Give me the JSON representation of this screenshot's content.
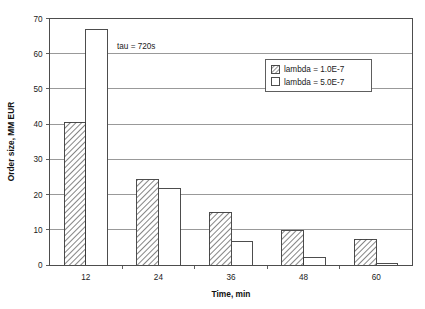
{
  "chart_data": {
    "type": "bar",
    "title": "",
    "xlabel": "Time, min",
    "ylabel": "Order size, MM EUR",
    "categories": [
      "12",
      "24",
      "36",
      "48",
      "60"
    ],
    "series": [
      {
        "name": "lambda = 1.0E-7",
        "values": [
          40.5,
          24.2,
          15.0,
          9.7,
          7.3
        ],
        "fill": "hatched"
      },
      {
        "name": "lambda = 5.0E-7",
        "values": [
          67.0,
          21.8,
          6.8,
          2.0,
          0.5
        ],
        "fill": "white"
      }
    ],
    "ylim": [
      0,
      70
    ],
    "ytick_labels": [
      "0",
      "10",
      "20",
      "30",
      "40",
      "50",
      "60",
      "70"
    ],
    "ytick_values": [
      0,
      10,
      20,
      30,
      40,
      50,
      60,
      70
    ],
    "xtick_labels": [
      "12",
      "24",
      "36",
      "48",
      "60"
    ],
    "grid": "horizontal",
    "legend_position": "upper-right-inside",
    "annotations": [
      {
        "text": "tau = 720s",
        "x_category": "12",
        "y_value": 62
      }
    ]
  },
  "legend": {
    "entries": [
      {
        "label": "lambda = 1.0E-7",
        "swatch": "hatched-swatch"
      },
      {
        "label": "lambda = 5.0E-7",
        "swatch": "white-swatch"
      }
    ]
  },
  "annotation": {
    "tau_label": "tau = 720s"
  },
  "axes": {
    "y_title": "Order size, MM EUR",
    "x_title": "Time, min",
    "y_ticks": [
      "70",
      "60",
      "50",
      "40",
      "30",
      "20",
      "10",
      "0"
    ],
    "x_ticks": [
      "12",
      "24",
      "36",
      "48",
      "60"
    ]
  },
  "colors": {
    "axis": "#4d4d4d",
    "grid": "#808080",
    "bar_outline": "#3a3a3a",
    "bar_fill_plain": "#ffffff",
    "hatch": "#555555",
    "background": "#ffffff",
    "text": "#1a1a1a"
  }
}
